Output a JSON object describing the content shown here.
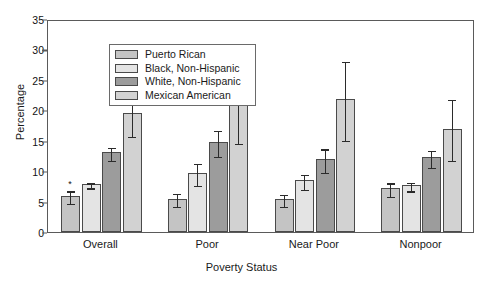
{
  "chart_data": {
    "type": "bar",
    "title": "",
    "xlabel": "Poverty Status",
    "ylabel": "Percentage",
    "categories": [
      "Overall",
      "Poor",
      "Near Poor",
      "Nonpoor"
    ],
    "ylim": [
      0,
      35
    ],
    "yticks": [
      0,
      5,
      10,
      15,
      20,
      25,
      30,
      35
    ],
    "ytick_labels": [
      "0",
      "5",
      "10",
      "15",
      "20",
      "25",
      "30",
      "35"
    ],
    "grid": false,
    "legend_position": "upper-left-inside",
    "error_bars": "symmetric",
    "annotations": [
      {
        "text": "*",
        "series": "Puerto Rican",
        "category": "Overall"
      }
    ],
    "series": [
      {
        "name": "Puerto Rican",
        "color": "#c4c4c4",
        "values": [
          6.0,
          5.5,
          5.4,
          7.2
        ],
        "errors": [
          1.0,
          1.1,
          1.0,
          1.1
        ]
      },
      {
        "name": "Black, Non-Hispanic",
        "color": "#e4e4e4",
        "values": [
          7.9,
          9.7,
          8.5,
          7.7
        ],
        "errors": [
          0.4,
          1.8,
          1.2,
          0.7
        ]
      },
      {
        "name": "White, Non-Hispanic",
        "color": "#9c9c9c",
        "values": [
          13.1,
          14.8,
          12.0,
          12.3
        ],
        "errors": [
          1.1,
          2.1,
          1.9,
          1.4
        ]
      },
      {
        "name": "Mexican American",
        "color": "#d2d2d2",
        "values": [
          19.5,
          21.2,
          21.8,
          17.0
        ],
        "errors": [
          3.5,
          6.4,
          6.5,
          5.0
        ]
      }
    ]
  }
}
